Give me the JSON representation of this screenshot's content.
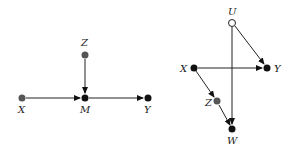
{
  "diagrams": [
    {
      "name": "left-graph",
      "nodes": {
        "X": {
          "label": "X",
          "x": 22,
          "y": 98,
          "fill": "#555555"
        },
        "Z": {
          "label": "Z",
          "x": 85,
          "y": 55,
          "fill": "#555555"
        },
        "M": {
          "label": "M",
          "x": 85,
          "y": 98,
          "fill": "#111111"
        },
        "Y": {
          "label": "Y",
          "x": 148,
          "y": 98,
          "fill": "#111111"
        }
      },
      "edges": [
        [
          "X",
          "M"
        ],
        [
          "Z",
          "M"
        ],
        [
          "M",
          "Y"
        ]
      ]
    },
    {
      "name": "right-graph",
      "nodes": {
        "U": {
          "label": "U",
          "x": 232,
          "y": 23,
          "fill": "#ffffff"
        },
        "X": {
          "label": "X",
          "x": 194,
          "y": 68,
          "fill": "#111111"
        },
        "Y": {
          "label": "Y",
          "x": 267,
          "y": 68,
          "fill": "#111111"
        },
        "Z": {
          "label": "Z",
          "x": 217,
          "y": 101,
          "fill": "#555555"
        },
        "W": {
          "label": "W",
          "x": 232,
          "y": 129,
          "fill": "#111111"
        }
      },
      "edges": [
        [
          "U",
          "Y"
        ],
        [
          "U",
          "W"
        ],
        [
          "X",
          "Y"
        ],
        [
          "X",
          "Z"
        ],
        [
          "Z",
          "W"
        ]
      ]
    }
  ]
}
